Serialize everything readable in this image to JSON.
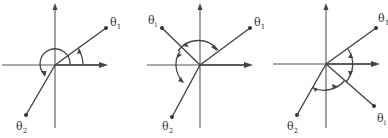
{
  "figure": {
    "panels": [
      {
        "id": "panel-1",
        "labels": {
          "theta1": "θ",
          "theta1_sub": "1",
          "theta2": "θ",
          "theta2_sub": "2"
        },
        "description": "Rays θ1 and θ2 from origin; angle arcs measured from positive x-axis"
      },
      {
        "id": "panel-2",
        "labels": {
          "thetai": "θ",
          "thetai_sub": "i",
          "theta1": "θ",
          "theta1_sub": "1",
          "theta2": "θ",
          "theta2_sub": "2"
        },
        "description": "Intermediate ray θi between θ1 and θ2; arcs θ1→θi and θi→θ2"
      },
      {
        "id": "panel-3",
        "labels": {
          "theta1": "θ",
          "theta1_sub": "1",
          "thetai": "θ",
          "thetai_sub": "i",
          "theta2": "θ",
          "theta2_sub": "2"
        },
        "description": "Intermediate ray θi below x-axis; clockwise arcs θ1→θi and θi→θ2"
      }
    ],
    "colors": {
      "line": "#444444",
      "axis": "#555555",
      "background": "#ffffff"
    }
  }
}
